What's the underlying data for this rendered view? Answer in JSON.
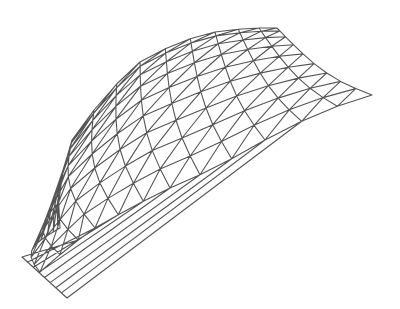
{
  "figure": {
    "stroke_color": "#555555",
    "background": "#ffffff"
  }
}
